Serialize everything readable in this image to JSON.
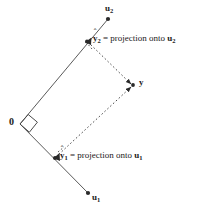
{
  "figure": {
    "type": "vector-projection-diagram",
    "background_color": "#ffffff",
    "line_color": "#3a3a3a",
    "dash_color": "#4a4a4a",
    "text_color": "#1a1a1a"
  },
  "labels": {
    "u2": {
      "symbol": "u",
      "subscript": "2"
    },
    "u1": {
      "symbol": "u",
      "subscript": "1"
    },
    "y": {
      "symbol": "y"
    },
    "origin": {
      "text": "0"
    },
    "yhat2": {
      "symbol": "y",
      "subscript": "2",
      "hat": "ˆ",
      "equals": " = projection onto ",
      "target_symbol": "u",
      "target_subscript": "2"
    },
    "yhat1": {
      "symbol": "y",
      "subscript": "1",
      "hat": "ˆ",
      "equals": " = projection onto ",
      "target_symbol": "u",
      "target_subscript": "1"
    }
  },
  "geometry": {
    "origin": {
      "x": 20,
      "y": 124
    },
    "u2_tip": {
      "x": 108,
      "y": 19
    },
    "u1_tip": {
      "x": 88,
      "y": 193
    },
    "yhat2": {
      "x": 87,
      "y": 41
    },
    "yhat1": {
      "x": 55,
      "y": 158
    },
    "y_point": {
      "x": 134,
      "y": 85
    },
    "right_angle_marker": "square-at-origin"
  }
}
